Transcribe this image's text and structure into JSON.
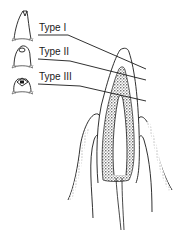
{
  "figure": {
    "labels": [
      {
        "text": "Type I",
        "x": 39,
        "y": 23
      },
      {
        "text": "Type II",
        "x": 39,
        "y": 47
      },
      {
        "text": "Type III",
        "x": 39,
        "y": 72
      }
    ],
    "colors": {
      "ink": "#1a1a1a",
      "stipple": "#555555",
      "background": "#ffffff"
    }
  }
}
